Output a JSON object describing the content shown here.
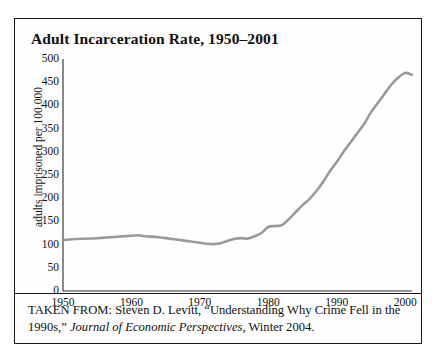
{
  "figure": {
    "title": "Adult Incarceration Rate, 1950–2001",
    "caption_part1": "TAKEN FROM: Steven D. Levitt, “Understanding Why Crime Fell in the 1990s,” ",
    "caption_journal": "Journal of Economic Perspectives",
    "caption_part2": ", Winter 2004."
  },
  "chart_data": {
    "type": "line",
    "title": "Adult Incarceration Rate, 1950–2001",
    "xlabel": "",
    "ylabel": "adults imprisoned per 100,000",
    "xlim": [
      1950,
      2001
    ],
    "ylim": [
      0,
      500
    ],
    "grid": false,
    "legend": null,
    "line_color": "#9a9a9a",
    "x_ticks": [
      1950,
      1960,
      1970,
      1980,
      1990,
      2000
    ],
    "y_ticks": [
      0,
      50,
      100,
      150,
      200,
      250,
      300,
      350,
      400,
      450,
      500
    ],
    "series": [
      {
        "name": "adults imprisoned per 100,000",
        "x": [
          1950,
          1952,
          1954,
          1956,
          1958,
          1960,
          1961,
          1962,
          1964,
          1966,
          1968,
          1970,
          1971,
          1972,
          1973,
          1974,
          1975,
          1976,
          1977,
          1978,
          1979,
          1980,
          1981,
          1982,
          1983,
          1984,
          1985,
          1986,
          1987,
          1988,
          1989,
          1990,
          1991,
          1992,
          1993,
          1994,
          1995,
          1996,
          1997,
          1998,
          1999,
          2000,
          2001
        ],
        "values": [
          110,
          112,
          113,
          115,
          117,
          119,
          120,
          118,
          116,
          112,
          108,
          104,
          102,
          101,
          103,
          108,
          112,
          114,
          113,
          118,
          125,
          138,
          140,
          142,
          155,
          170,
          185,
          198,
          215,
          235,
          258,
          278,
          300,
          320,
          340,
          360,
          385,
          405,
          425,
          445,
          460,
          470,
          466
        ]
      }
    ]
  }
}
